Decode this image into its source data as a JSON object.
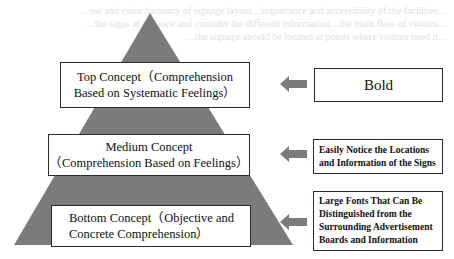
{
  "background_text": {
    "lines": [
      "…use and color harmony of signage layout…importance and accessibility of the facilities…",
      "…the signs at a glance and consider the different information…the main flow of visitors…",
      "…the signage should be located at points where visitors need it…"
    ]
  },
  "colors": {
    "pyramid_fill": "#7b7b7b",
    "arrow_fill": "#7b7b7b",
    "box_border": "#2a2a2a",
    "box_fill": "#ffffff",
    "background": "#ffffff"
  },
  "pyramid": {
    "levels": [
      {
        "id": "top",
        "label_line1": "Top Concept（Comprehension",
        "label_line2": "Based on Systematic Feelings）"
      },
      {
        "id": "medium",
        "label_line1": "Medium Concept",
        "label_line2": "（Comprehension Based on Feelings）"
      },
      {
        "id": "bottom",
        "label_line1": "Bottom Concept（Objective and",
        "label_line2": "Concrete Comprehension）"
      }
    ]
  },
  "requirements": [
    {
      "id": "top",
      "lines": [
        "Bold"
      ]
    },
    {
      "id": "medium",
      "lines": [
        "Easily Notice the Locations",
        "and Information of the Signs"
      ]
    },
    {
      "id": "bottom",
      "lines": [
        "Large Fonts That Can Be",
        "Distinguished from the",
        "Surrounding Advertisement",
        "Boards and Information"
      ]
    }
  ],
  "arrows": [
    {
      "direction": "left",
      "from": "requirement-top",
      "to": "pyramid-top"
    },
    {
      "direction": "left",
      "from": "requirement-medium",
      "to": "pyramid-medium"
    },
    {
      "direction": "left",
      "from": "requirement-bottom",
      "to": "pyramid-bottom"
    }
  ]
}
